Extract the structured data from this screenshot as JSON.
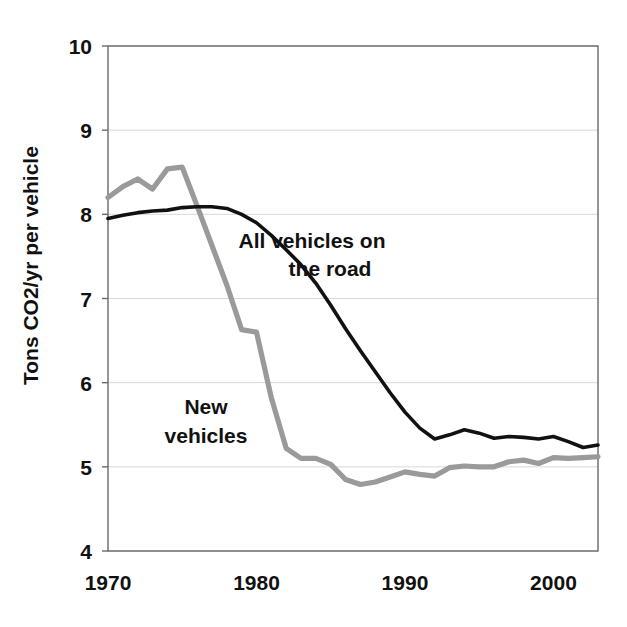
{
  "chart_data": {
    "type": "line",
    "title": "",
    "subtitle": "",
    "xlabel": "",
    "ylabel": "Tons CO2/yr per vehicle",
    "xlim": [
      1970,
      2003
    ],
    "ylim": [
      4,
      10
    ],
    "ytick_labels": [
      "10",
      "9",
      "8",
      "7",
      "6",
      "5",
      "4"
    ],
    "ytick_values": [
      10,
      9,
      8,
      7,
      6,
      5,
      4
    ],
    "xtick_labels": [
      "1970",
      "1980",
      "1990",
      "2000"
    ],
    "xtick_values": [
      1970,
      1980,
      1990,
      2000
    ],
    "grid": "horizontal",
    "legend_position": "inline-annotations",
    "x": [
      1970,
      1971,
      1972,
      1973,
      1974,
      1975,
      1976,
      1977,
      1978,
      1979,
      1980,
      1981,
      1982,
      1983,
      1984,
      1985,
      1986,
      1987,
      1988,
      1989,
      1990,
      1991,
      1992,
      1993,
      1994,
      1995,
      1996,
      1997,
      1998,
      1999,
      2000,
      2001,
      2002,
      2003
    ],
    "series": [
      {
        "name": "All vehicles on the road",
        "color": "#111111",
        "annotation": "All vehicles on\nthe road",
        "annotation_line1": "All vehicles on",
        "annotation_line2": "the road",
        "values": [
          7.95,
          7.99,
          8.02,
          8.04,
          8.05,
          8.08,
          8.09,
          8.09,
          8.07,
          8.0,
          7.9,
          7.75,
          7.58,
          7.4,
          7.18,
          6.92,
          6.64,
          6.38,
          6.13,
          5.88,
          5.65,
          5.46,
          5.33,
          5.38,
          5.44,
          5.4,
          5.34,
          5.36,
          5.35,
          5.33,
          5.36,
          5.3,
          5.23,
          5.26
        ]
      },
      {
        "name": "New vehicles",
        "color": "#9a9a9a",
        "annotation": "New\nvehicles",
        "annotation_line1": "New",
        "annotation_line2": "vehicles",
        "values": [
          8.2,
          8.33,
          8.42,
          8.3,
          8.54,
          8.56,
          8.1,
          7.63,
          7.16,
          6.63,
          6.6,
          5.82,
          5.22,
          5.1,
          5.1,
          5.03,
          4.85,
          4.79,
          4.82,
          4.88,
          4.94,
          4.91,
          4.89,
          4.99,
          5.01,
          5.0,
          5.0,
          5.06,
          5.08,
          5.04,
          5.11,
          5.1,
          5.11,
          5.12
        ]
      }
    ]
  },
  "annotations": {
    "all_vehicles": {
      "line1": "All vehicles on",
      "line2": "the road"
    },
    "new_vehicles": {
      "line1": "New",
      "line2": "vehicles"
    }
  },
  "axes": {
    "y_title": "Tons CO2/yr per vehicle"
  },
  "colors": {
    "black_series": "#111111",
    "gray_series": "#9a9a9a",
    "grid": "#d8d8d8",
    "frame": "#6a6a6a",
    "background": "#ffffff"
  }
}
